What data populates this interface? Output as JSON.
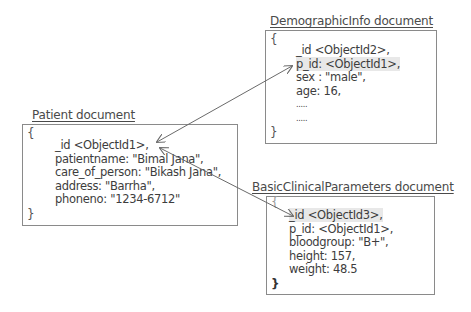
{
  "diagram": {
    "patient": {
      "title": "Patient document",
      "open_brace": "{",
      "close_brace": "}",
      "fields": [
        "_id <ObjectId1>,",
        "patientname:  \"Bimal Jana\",",
        "care_of_person: \"Bikash Jana\",",
        "address: \"Barrha\",",
        "phoneno: \"1234-6712\""
      ]
    },
    "demographic": {
      "title": "DemographicInfo document",
      "open_brace": "{",
      "close_brace": "}",
      "fields": [
        "_id <ObjectId2>,",
        "p_id: <ObjectId1>,",
        "sex : \"male\",",
        "age: 16,",
        ".....",
        "....."
      ]
    },
    "clinical": {
      "title": "BasicClinicalParameters document",
      "open_brace": "{",
      "close_brace": "}",
      "fields": [
        "_id <ObjectId3>,",
        "p_id: <ObjectId1>,",
        "bloodgroup: \"B+\",",
        "height: 157,",
        "weight: 48.5"
      ]
    },
    "links": [
      {
        "from": "demographic.p_id",
        "to": "patient._id",
        "style": "double-arrow"
      },
      {
        "from": "clinical._id",
        "to": "patient._id",
        "style": "double-arrow"
      }
    ],
    "colors": {
      "border": "#8a8a8a",
      "text": "#3d3d3d",
      "highlight": "#e8e8e8",
      "arrow": "#6a6a6a"
    }
  }
}
